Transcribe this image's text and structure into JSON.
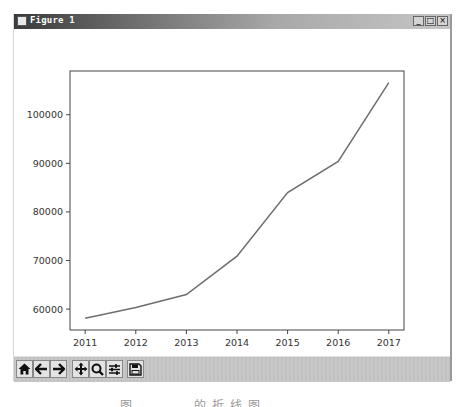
{
  "window": {
    "title": "Figure 1",
    "controls": {
      "minimize": "_",
      "maximize": "□",
      "close": "×"
    }
  },
  "toolbar": {
    "buttons": [
      {
        "name": "home",
        "icon": "home-icon"
      },
      {
        "name": "back",
        "icon": "arrow-left-icon"
      },
      {
        "name": "forward",
        "icon": "arrow-right-icon"
      },
      {
        "name": "pan",
        "icon": "move-icon"
      },
      {
        "name": "zoom",
        "icon": "magnifier-icon"
      },
      {
        "name": "configure-subplots",
        "icon": "sliders-icon"
      },
      {
        "name": "save",
        "icon": "floppy-disk-icon"
      }
    ]
  },
  "caption": "图 …… 的折线图",
  "chart_data": {
    "type": "line",
    "title": "",
    "xlabel": "",
    "ylabel": "",
    "x": [
      2011,
      2012,
      2013,
      2014,
      2015,
      2016,
      2017
    ],
    "series": [
      {
        "name": "",
        "color": "#6e6e6e",
        "values": [
          58100,
          60300,
          63000,
          70900,
          84000,
          90400,
          106600
        ]
      }
    ],
    "xticks": [
      "2011",
      "2012",
      "2013",
      "2014",
      "2015",
      "2016",
      "2017"
    ],
    "yticks": [
      "60000",
      "70000",
      "80000",
      "90000",
      "100000"
    ],
    "ytick_values": [
      60000,
      70000,
      80000,
      90000,
      100000
    ],
    "xlim": [
      2010.7,
      2017.3
    ],
    "ylim": [
      55700,
      109000
    ],
    "grid": false,
    "legend": false
  }
}
